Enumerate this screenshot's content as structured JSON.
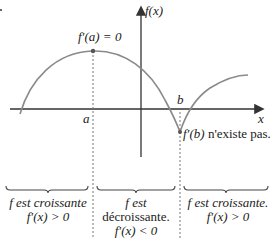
{
  "axes": {
    "y_label": "f(x)",
    "x_label": "x"
  },
  "points": {
    "a": {
      "label": "a",
      "annotation": "f′(a) = 0"
    },
    "b": {
      "label": "b",
      "annotation_math": "f′(b)",
      "annotation_text": " n'existe pas."
    }
  },
  "intervals": [
    {
      "line1": "f est croissante",
      "line2": "f′(x) > 0"
    },
    {
      "line1": "f est",
      "line2": "décroissante.",
      "line3": "f′(x) < 0"
    },
    {
      "line1": "f est croissante.",
      "line2": "f′(x) > 0"
    }
  ],
  "colors": {
    "curve": "#8a8a8a",
    "axes": "#333333",
    "dash": "#777777",
    "text": "#222222"
  }
}
